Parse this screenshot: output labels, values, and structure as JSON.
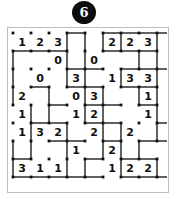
{
  "header": {
    "badge_number": "6",
    "badge_color": "#0d0d0d",
    "badge_text_color": "#ffffff"
  },
  "frame": {
    "border_color": "#bdbdbd",
    "background": "#ffffff"
  },
  "puzzle": {
    "type": "slitherlink",
    "rows": 8,
    "cols": 8,
    "dot_rows": 9,
    "dot_cols": 9,
    "cell_size": 18,
    "dot_color": "#111111",
    "line_color": "#3a3a3a",
    "clue_color": "#101010",
    "clues": [
      [
        "1",
        "2",
        "3",
        "",
        "",
        "2",
        "2",
        "3"
      ],
      [
        "",
        "",
        "0",
        "",
        "0",
        "",
        "",
        ""
      ],
      [
        "",
        "0",
        "",
        "3",
        "",
        "1",
        "3",
        "3"
      ],
      [
        "2",
        "",
        "",
        "0",
        "3",
        "",
        "",
        "1"
      ],
      [
        "1",
        "",
        "",
        "1",
        "2",
        "",
        "",
        "1"
      ],
      [
        "1",
        "3",
        "2",
        "",
        "2",
        "",
        "2",
        ""
      ],
      [
        "",
        "",
        "",
        "1",
        "",
        "2",
        "",
        ""
      ],
      [
        "3",
        "1",
        "1",
        "",
        "",
        "1",
        "2",
        "2"
      ]
    ],
    "h_edges": [
      [
        0,
        0,
        0,
        1,
        0,
        1,
        1,
        1,
        1
      ],
      [
        1,
        1,
        1,
        0,
        0,
        1,
        1,
        1,
        0
      ],
      [
        0,
        0,
        0,
        1,
        1,
        0,
        1,
        1,
        1
      ],
      [
        0,
        1,
        0,
        1,
        1,
        0,
        1,
        1,
        0
      ],
      [
        0,
        0,
        1,
        0,
        1,
        1,
        0,
        1,
        0
      ],
      [
        0,
        1,
        1,
        0,
        1,
        1,
        0,
        0,
        1
      ],
      [
        0,
        0,
        1,
        1,
        0,
        1,
        0,
        1,
        1
      ],
      [
        1,
        0,
        0,
        0,
        1,
        0,
        1,
        1,
        0
      ],
      [
        1,
        1,
        1,
        1,
        1,
        0,
        1,
        1,
        1
      ]
    ],
    "v_edges": [
      [
        0,
        0,
        0,
        1,
        1,
        1,
        1,
        0,
        1
      ],
      [
        1,
        0,
        0,
        1,
        1,
        0,
        0,
        1,
        1
      ],
      [
        1,
        0,
        0,
        1,
        1,
        0,
        1,
        0,
        1
      ],
      [
        1,
        0,
        1,
        0,
        1,
        1,
        0,
        1,
        1
      ],
      [
        0,
        1,
        1,
        0,
        1,
        1,
        0,
        0,
        1
      ],
      [
        0,
        1,
        0,
        1,
        0,
        1,
        1,
        0,
        1
      ],
      [
        1,
        1,
        0,
        1,
        0,
        1,
        1,
        1,
        0
      ],
      [
        1,
        0,
        0,
        1,
        1,
        0,
        1,
        0,
        1
      ]
    ]
  }
}
